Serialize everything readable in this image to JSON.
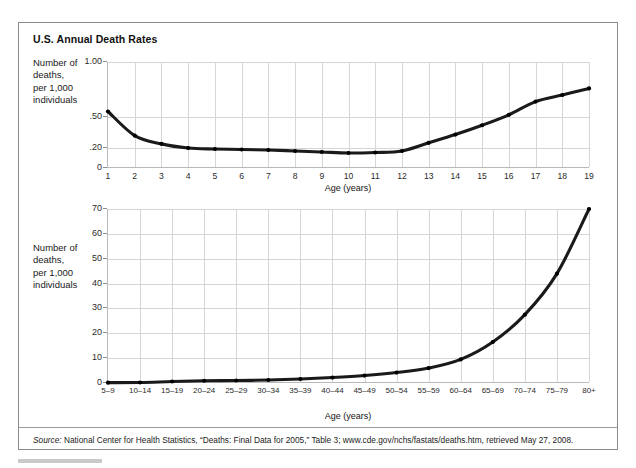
{
  "figure": {
    "title": "U.S. Annual Death Rates",
    "source_prefix": "Source:",
    "source_text": " National Center for Health Statistics, “Deaths: Final Data for 2005,” Table 3; www.cde.gov/nchs/fastats/deaths.htm, retrieved May 27, 2008."
  },
  "axis_title": {
    "line1": "Number of",
    "line2": "deaths,",
    "line3": "per 1,000",
    "line4": "individuals"
  },
  "chart_data": [
    {
      "type": "line",
      "id": "children-ages-1-19",
      "title": "",
      "xlabel": "Age (years)",
      "ylabel": "Number of deaths, per 1,000 individuals",
      "categories": [
        "1",
        "2",
        "3",
        "4",
        "5",
        "6",
        "7",
        "8",
        "9",
        "10",
        "11",
        "12",
        "13",
        "14",
        "15",
        "16",
        "17",
        "18",
        "19"
      ],
      "values": [
        0.55,
        0.32,
        0.24,
        0.2,
        0.19,
        0.185,
        0.18,
        0.17,
        0.16,
        0.15,
        0.155,
        0.17,
        0.25,
        0.33,
        0.42,
        0.52,
        0.64,
        0.7,
        0.76
      ],
      "ytick_labels": [
        "1.00",
        ".50",
        ".20",
        "0"
      ],
      "ytick_values": [
        1.0,
        0.5,
        0.2,
        0.0
      ],
      "ylim": [
        0,
        1.0
      ],
      "y_scale": "nonlinear",
      "grid": true,
      "legend": "none"
    },
    {
      "type": "line",
      "id": "adults-age-bands",
      "title": "",
      "xlabel": "Age (years)",
      "ylabel": "Number of deaths, per 1,000 individuals",
      "categories": [
        "5–9",
        "10–14",
        "15–19",
        "20–24",
        "25–29",
        "30–34",
        "35–39",
        "40–44",
        "45–49",
        "50–54",
        "55–59",
        "60–64",
        "65–69",
        "70–74",
        "75–79",
        "80+"
      ],
      "values": [
        0.15,
        0.2,
        0.6,
        0.9,
        1.0,
        1.2,
        1.6,
        2.2,
        3.0,
        4.2,
        6.0,
        9.5,
        16.5,
        27.5,
        44.0,
        70.0
      ],
      "ytick_labels": [
        "70",
        "60",
        "50",
        "40",
        "30",
        "20",
        "10",
        "0"
      ],
      "ytick_values": [
        70,
        60,
        50,
        40,
        30,
        20,
        10,
        0
      ],
      "ylim": [
        0,
        70
      ],
      "grid": true,
      "legend": "none"
    }
  ]
}
